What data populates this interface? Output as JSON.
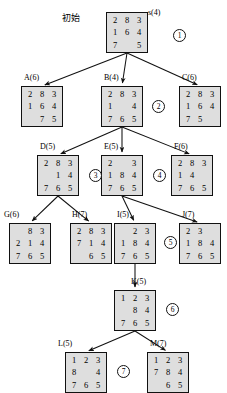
{
  "figure": {
    "start_label": "初始",
    "nodes": [
      {
        "id": "s",
        "label": "s(4)",
        "tiles": [
          "2",
          "8",
          "3",
          "1",
          "6",
          "4",
          "7",
          "",
          "5"
        ],
        "x": 106,
        "y": 12,
        "label_x": 148,
        "label_y": 9
      },
      {
        "id": "A",
        "label": "A(6)",
        "tiles": [
          "2",
          "8",
          "3",
          "1",
          "6",
          "4",
          "",
          "7",
          "5"
        ],
        "x": 21,
        "y": 86,
        "label_x": 24,
        "label_y": 74
      },
      {
        "id": "B",
        "label": "B(4)",
        "tiles": [
          "2",
          "8",
          "3",
          "1",
          "",
          "4",
          "7",
          "6",
          "5"
        ],
        "x": 101,
        "y": 86,
        "label_x": 104,
        "label_y": 74
      },
      {
        "id": "C",
        "label": "C(6)",
        "tiles": [
          "2",
          "8",
          "3",
          "1",
          "6",
          "4",
          "7",
          "5",
          ""
        ],
        "x": 179,
        "y": 86,
        "label_x": 182,
        "label_y": 74
      },
      {
        "id": "D",
        "label": "D(5)",
        "tiles": [
          "2",
          "8",
          "3",
          "",
          "1",
          "4",
          "7",
          "6",
          "5"
        ],
        "x": 37,
        "y": 155,
        "label_x": 40,
        "label_y": 143
      },
      {
        "id": "E",
        "label": "E(5)",
        "tiles": [
          "2",
          "",
          "3",
          "1",
          "8",
          "4",
          "7",
          "6",
          "5"
        ],
        "x": 101,
        "y": 155,
        "label_x": 104,
        "label_y": 143
      },
      {
        "id": "F",
        "label": "F(6)",
        "tiles": [
          "2",
          "8",
          "3",
          "1",
          "4",
          "",
          "7",
          "6",
          "5"
        ],
        "x": 171,
        "y": 155,
        "label_x": 174,
        "label_y": 143
      },
      {
        "id": "G",
        "label": "G(6)",
        "tiles": [
          "",
          "8",
          "3",
          "2",
          "1",
          "4",
          "7",
          "6",
          "5"
        ],
        "x": 9,
        "y": 223,
        "label_x": 4,
        "label_y": 211
      },
      {
        "id": "H",
        "label": "H(7)",
        "tiles": [
          "2",
          "8",
          "3",
          "7",
          "1",
          "4",
          "",
          "6",
          "5"
        ],
        "x": 70,
        "y": 223,
        "label_x": 72,
        "label_y": 211
      },
      {
        "id": "I",
        "label": "I(5)",
        "tiles": [
          "",
          "2",
          "3",
          "1",
          "8",
          "4",
          "7",
          "6",
          "5"
        ],
        "x": 114,
        "y": 223,
        "label_x": 117,
        "label_y": 211
      },
      {
        "id": "J",
        "label": "J(7)",
        "tiles": [
          "2",
          "3",
          "",
          "1",
          "8",
          "4",
          "7",
          "6",
          "5"
        ],
        "x": 179,
        "y": 223,
        "label_x": 182,
        "label_y": 211
      },
      {
        "id": "K",
        "label": "K(5)",
        "tiles": [
          "1",
          "2",
          "3",
          "",
          "8",
          "4",
          "7",
          "6",
          "5"
        ],
        "x": 114,
        "y": 290,
        "label_x": 131,
        "label_y": 278
      },
      {
        "id": "L",
        "label": "L(5)",
        "tiles": [
          "1",
          "2",
          "3",
          "8",
          "",
          "4",
          "7",
          "6",
          "5"
        ],
        "x": 65,
        "y": 352,
        "label_x": 58,
        "label_y": 340
      },
      {
        "id": "M",
        "label": "M(7)",
        "tiles": [
          "1",
          "2",
          "3",
          "7",
          "8",
          "4",
          "",
          "6",
          "5"
        ],
        "x": 147,
        "y": 352,
        "label_x": 150,
        "label_y": 340
      }
    ],
    "order_markers": [
      {
        "n": "1",
        "x": 173,
        "y": 29
      },
      {
        "n": "2",
        "x": 152,
        "y": 100
      },
      {
        "n": "3",
        "x": 89,
        "y": 169
      },
      {
        "n": "4",
        "x": 153,
        "y": 169
      },
      {
        "n": "5",
        "x": 164,
        "y": 236
      },
      {
        "n": "6",
        "x": 166,
        "y": 303
      },
      {
        "n": "7",
        "x": 117,
        "y": 365
      }
    ],
    "edges": [
      {
        "from": "s",
        "to": "A"
      },
      {
        "from": "s",
        "to": "B"
      },
      {
        "from": "s",
        "to": "C"
      },
      {
        "from": "B",
        "to": "D"
      },
      {
        "from": "B",
        "to": "E"
      },
      {
        "from": "B",
        "to": "F"
      },
      {
        "from": "D",
        "to": "G"
      },
      {
        "from": "D",
        "to": "H"
      },
      {
        "from": "E",
        "to": "I"
      },
      {
        "from": "E",
        "to": "J"
      },
      {
        "from": "I",
        "to": "K"
      },
      {
        "from": "K",
        "to": "L"
      },
      {
        "from": "K",
        "to": "M"
      }
    ],
    "colors": {
      "node_fill": "#dedede",
      "node_border": "#111111",
      "edge": "#111111",
      "text": "#000000",
      "background": "#ffffff"
    }
  }
}
